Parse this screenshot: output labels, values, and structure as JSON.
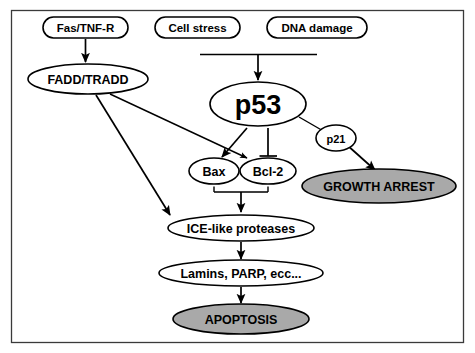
{
  "figure": {
    "frame": {
      "stroke": "#3a3a3a"
    },
    "colors": {
      "outcome_fill": "#a9a9a9",
      "node_fill": "#ffffff",
      "stroke": "#000000"
    }
  },
  "nodes": {
    "fas_tnf_r": {
      "label": "Fas/TNF-R",
      "shape": "rounded-rect",
      "fill": "#ffffff"
    },
    "cell_stress": {
      "label": "Cell stress",
      "shape": "rounded-rect",
      "fill": "#ffffff"
    },
    "dna_damage": {
      "label": "DNA damage",
      "shape": "rounded-rect",
      "fill": "#ffffff"
    },
    "fadd_tradd": {
      "label": "FADD/TRADD",
      "shape": "ellipse",
      "fill": "#ffffff"
    },
    "p53": {
      "label": "p53",
      "shape": "ellipse",
      "fill": "#ffffff"
    },
    "p21": {
      "label": "p21",
      "shape": "ellipse",
      "fill": "#ffffff"
    },
    "bax": {
      "label": "Bax",
      "shape": "ellipse",
      "fill": "#ffffff"
    },
    "bcl2": {
      "label": "Bcl-2",
      "shape": "ellipse",
      "fill": "#ffffff"
    },
    "growth_arrest": {
      "label": "GROWTH ARREST",
      "shape": "ellipse",
      "fill": "#a9a9a9"
    },
    "ice_proteases": {
      "label": "ICE-like proteases",
      "shape": "ellipse",
      "fill": "#ffffff"
    },
    "substrates": {
      "label": "Lamins, PARP, ecc...",
      "shape": "ellipse",
      "fill": "#ffffff"
    },
    "apoptosis": {
      "label": "APOPTOSIS",
      "shape": "ellipse",
      "fill": "#a9a9a9"
    }
  },
  "edges": [
    {
      "from": "fas_tnf_r",
      "to": "fadd_tradd",
      "type": "arrow"
    },
    {
      "from": "cell_stress",
      "to": "p53",
      "type": "arrow-via-bar"
    },
    {
      "from": "dna_damage",
      "to": "p53",
      "type": "arrow-via-bar"
    },
    {
      "from": "fadd_tradd",
      "to": "ice_proteases",
      "type": "arrow"
    },
    {
      "from": "fadd_tradd",
      "to": "bcl2",
      "type": "arrow"
    },
    {
      "from": "p53",
      "to": "bax",
      "type": "arrow"
    },
    {
      "from": "p53",
      "to": "bcl2",
      "type": "inhibition"
    },
    {
      "from": "p53",
      "to": "growth_arrest",
      "type": "arrow-via-p21"
    },
    {
      "from": "bax_bcl2_bracket",
      "to": "ice_proteases",
      "type": "arrow"
    },
    {
      "from": "ice_proteases",
      "to": "substrates",
      "type": "arrow"
    },
    {
      "from": "substrates",
      "to": "apoptosis",
      "type": "arrow"
    }
  ]
}
